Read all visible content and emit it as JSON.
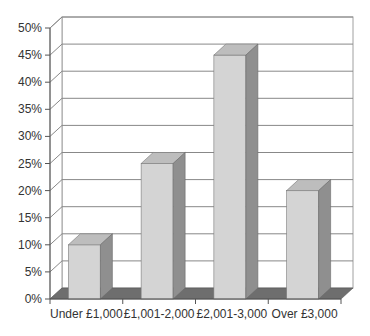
{
  "chart_data": {
    "type": "bar",
    "style": "3d-column",
    "title": "",
    "xlabel": "",
    "ylabel": "",
    "categories": [
      "Under £1,000",
      "£1,001-2,000",
      "£2,001-3,000",
      "Over £3,000"
    ],
    "values": [
      10,
      25,
      45,
      20
    ],
    "value_unit": "%",
    "ylim": [
      0,
      50
    ],
    "yticks": [
      "0%",
      "5%",
      "10%",
      "15%",
      "20%",
      "25%",
      "30%",
      "35%",
      "40%",
      "45%",
      "50%"
    ],
    "grid": true,
    "legend": null,
    "colors": {
      "bar_front": "#d4d4d4",
      "bar_top": "#bdbdbd",
      "bar_side": "#8f8f8f",
      "floor": "#6e6e6e",
      "grid": "#888888",
      "axis": "#555555"
    }
  }
}
